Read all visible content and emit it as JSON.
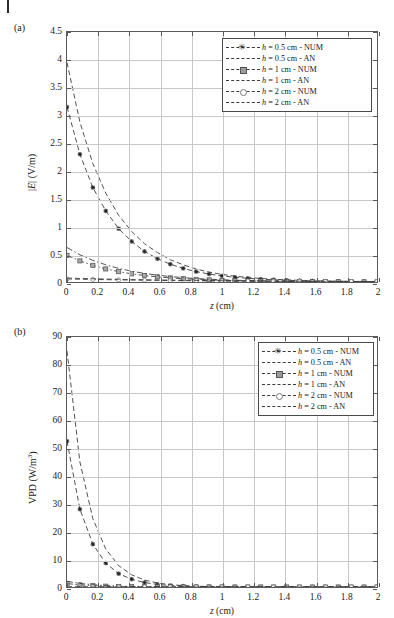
{
  "header": {
    "rule": "page-edge-rule",
    "faded_text": ""
  },
  "figure": {
    "panels": [
      {
        "id": "a",
        "label": "(a)",
        "xlabel_italic": "z",
        "xlabel_unit": " (cm)",
        "ylabel": "|E| (V/m)",
        "ylabel_italic": "E",
        "ylabel_pre": "|",
        "ylabel_post": "| (V/m)"
      },
      {
        "id": "b",
        "label": "(b)",
        "xlabel_italic": "z",
        "xlabel_unit": " (cm)",
        "ylabel": "VPD (W/m3)",
        "ylabel_pre": "VPD (W/m",
        "ylabel_sup": "3",
        "ylabel_post": ")"
      }
    ],
    "legend_entries": [
      {
        "label": "h = 0.5 cm - NUM",
        "style": "dashed",
        "marker": "star"
      },
      {
        "label": "h = 0.5 cm - AN",
        "style": "dashed",
        "marker": "none"
      },
      {
        "label": "h = 1 cm - NUM",
        "style": "dash-dot",
        "marker": "square"
      },
      {
        "label": "h = 1 cm - AN",
        "style": "dash-dot",
        "marker": "none"
      },
      {
        "label": "h = 2 cm - NUM",
        "style": "dashed",
        "marker": "circle"
      },
      {
        "label": "h = 2 cm - AN",
        "style": "dashed",
        "marker": "none"
      }
    ],
    "legend_label_parts": [
      {
        "it": "h",
        "rest": " = 0.5 cm - NUM"
      },
      {
        "it": "h",
        "rest": " = 0.5 cm - AN"
      },
      {
        "it": "h",
        "rest": " = 1 cm - NUM"
      },
      {
        "it": "h",
        "rest": " = 1 cm - AN"
      },
      {
        "it": "h",
        "rest": " = 2 cm - NUM"
      },
      {
        "it": "h",
        "rest": " = 2 cm - AN"
      }
    ]
  },
  "chart_data": [
    {
      "type": "line",
      "panel": "a",
      "title": "",
      "xlabel": "z (cm)",
      "ylabel": "|E| (V/m)",
      "xlim": [
        0,
        2
      ],
      "ylim": [
        0,
        4.5
      ],
      "xticks": [
        0,
        0.2,
        0.4,
        0.6,
        0.8,
        1,
        1.2,
        1.4,
        1.6,
        1.8,
        2
      ],
      "xticklabels": [
        "0",
        "0.2",
        "0.4",
        "0.6",
        "0.8",
        "1",
        "1.2",
        "1.4",
        "1.6",
        "1.8",
        "2"
      ],
      "yticks": [
        0,
        0.5,
        1,
        1.5,
        2,
        2.5,
        3,
        3.5,
        4,
        4.5
      ],
      "yticklabels": [
        "0",
        "0.5",
        "1",
        "1.5",
        "2",
        "2.5",
        "3",
        "3.5",
        "4",
        "4.5"
      ],
      "grid": true,
      "legend_position": "upper right",
      "x": [
        0,
        0.0833,
        0.1667,
        0.25,
        0.3333,
        0.4167,
        0.5,
        0.5833,
        0.6667,
        0.75,
        0.8333,
        0.9167,
        1.0,
        1.0833,
        1.1667,
        1.25,
        1.3333,
        1.4167,
        1.5,
        1.5833,
        1.6667,
        1.75,
        1.8333,
        1.9167,
        2.0
      ],
      "series": [
        {
          "name": "h = 0.5 cm - NUM",
          "marker": "star",
          "linestyle": "dashed",
          "values": [
            3.15,
            2.3,
            1.7,
            1.28,
            0.96,
            0.73,
            0.55,
            0.42,
            0.32,
            0.245,
            0.187,
            0.143,
            0.11,
            0.085,
            0.066,
            0.051,
            0.04,
            0.031,
            0.024,
            0.019,
            0.015,
            0.012,
            0.01,
            0.008,
            0.006
          ]
        },
        {
          "name": "h = 0.5 cm - AN",
          "marker": "none",
          "linestyle": "dashed",
          "values": [
            3.95,
            2.88,
            2.13,
            1.6,
            1.2,
            0.91,
            0.69,
            0.53,
            0.4,
            0.31,
            0.234,
            0.179,
            0.137,
            0.106,
            0.082,
            0.064,
            0.05,
            0.039,
            0.03,
            0.024,
            0.019,
            0.015,
            0.012,
            0.01,
            0.008
          ]
        },
        {
          "name": "h = 1 cm - NUM",
          "marker": "square",
          "linestyle": "dash-dot",
          "values": [
            0.48,
            0.38,
            0.3,
            0.235,
            0.186,
            0.147,
            0.117,
            0.093,
            0.074,
            0.059,
            0.047,
            0.038,
            0.03,
            0.024,
            0.019,
            0.016,
            0.013,
            0.01,
            0.008,
            0.007,
            0.005,
            0.004,
            0.004,
            0.003,
            0.002
          ]
        },
        {
          "name": "h = 1 cm - AN",
          "marker": "none",
          "linestyle": "dash-dot",
          "values": [
            0.62,
            0.49,
            0.39,
            0.31,
            0.245,
            0.195,
            0.155,
            0.123,
            0.098,
            0.078,
            0.062,
            0.05,
            0.04,
            0.032,
            0.026,
            0.021,
            0.017,
            0.013,
            0.011,
            0.009,
            0.007,
            0.006,
            0.005,
            0.004,
            0.003
          ]
        },
        {
          "name": "h = 2 cm - NUM",
          "marker": "circle",
          "linestyle": "dashed",
          "values": [
            0.055,
            0.05,
            0.046,
            0.042,
            0.038,
            0.035,
            0.032,
            0.029,
            0.026,
            0.024,
            0.022,
            0.02,
            0.018,
            0.016,
            0.015,
            0.014,
            0.012,
            0.011,
            0.01,
            0.009,
            0.008,
            0.008,
            0.007,
            0.006,
            0.006
          ]
        },
        {
          "name": "h = 2 cm - AN",
          "marker": "none",
          "linestyle": "dashed",
          "values": [
            0.07,
            0.064,
            0.058,
            0.053,
            0.049,
            0.044,
            0.04,
            0.037,
            0.034,
            0.031,
            0.028,
            0.026,
            0.023,
            0.021,
            0.019,
            0.018,
            0.016,
            0.015,
            0.013,
            0.012,
            0.011,
            0.01,
            0.009,
            0.008,
            0.008
          ]
        }
      ]
    },
    {
      "type": "line",
      "panel": "b",
      "title": "",
      "xlabel": "z (cm)",
      "ylabel": "VPD (W/m3)",
      "xlim": [
        0,
        2
      ],
      "ylim": [
        0,
        90
      ],
      "xticks": [
        0,
        0.2,
        0.4,
        0.6,
        0.8,
        1,
        1.2,
        1.4,
        1.6,
        1.8,
        2
      ],
      "xticklabels": [
        "0",
        "0.2",
        "0.4",
        "0.6",
        "0.8",
        "1",
        "1.2",
        "1.4",
        "1.6",
        "1.8",
        "2"
      ],
      "yticks": [
        0,
        10,
        20,
        30,
        40,
        50,
        60,
        70,
        80,
        90
      ],
      "yticklabels": [
        "0",
        "10",
        "20",
        "30",
        "40",
        "50",
        "60",
        "70",
        "80",
        "90"
      ],
      "grid": true,
      "legend_position": "upper right",
      "x": [
        0,
        0.0833,
        0.1667,
        0.25,
        0.3333,
        0.4167,
        0.5,
        0.5833,
        0.6667,
        0.75,
        0.8333,
        0.9167,
        1.0,
        1.0833,
        1.1667,
        1.25,
        1.3333,
        1.4167,
        1.5,
        1.5833,
        1.6667,
        1.75,
        1.8333,
        1.9167,
        2.0
      ],
      "series": [
        {
          "name": "h = 0.5 cm - NUM",
          "marker": "star",
          "linestyle": "dashed",
          "values": [
            52.5,
            28.0,
            15.4,
            8.6,
            4.8,
            2.8,
            1.6,
            0.93,
            0.54,
            0.32,
            0.19,
            0.11,
            0.065,
            0.04,
            0.024,
            0.014,
            0.009,
            0.005,
            0.003,
            0.002,
            0.001,
            0.001,
            0.0,
            0.0,
            0.0
          ]
        },
        {
          "name": "h = 0.5 cm - AN",
          "marker": "none",
          "linestyle": "dashed",
          "values": [
            85.0,
            45.0,
            24.6,
            13.7,
            7.7,
            4.4,
            2.5,
            1.45,
            0.85,
            0.5,
            0.29,
            0.17,
            0.1,
            0.06,
            0.036,
            0.021,
            0.013,
            0.008,
            0.005,
            0.003,
            0.002,
            0.001,
            0.001,
            0.0,
            0.0
          ]
        },
        {
          "name": "h = 1 cm - NUM",
          "marker": "square",
          "linestyle": "dash-dot",
          "values": [
            1.22,
            0.77,
            0.48,
            0.3,
            0.19,
            0.12,
            0.075,
            0.047,
            0.03,
            0.019,
            0.012,
            0.008,
            0.005,
            0.003,
            0.002,
            0.001,
            0.001,
            0.001,
            0.0,
            0.0,
            0.0,
            0.0,
            0.0,
            0.0,
            0.0
          ]
        },
        {
          "name": "h = 1 cm - AN",
          "marker": "none",
          "linestyle": "dash-dot",
          "values": [
            2.05,
            1.29,
            0.81,
            0.51,
            0.32,
            0.2,
            0.126,
            0.079,
            0.05,
            0.031,
            0.02,
            0.012,
            0.008,
            0.005,
            0.003,
            0.002,
            0.001,
            0.001,
            0.0,
            0.0,
            0.0,
            0.0,
            0.0,
            0.0,
            0.0
          ]
        },
        {
          "name": "h = 2 cm - NUM",
          "marker": "circle",
          "linestyle": "dashed",
          "values": [
            0.016,
            0.013,
            0.011,
            0.009,
            0.008,
            0.006,
            0.005,
            0.004,
            0.004,
            0.003,
            0.002,
            0.002,
            0.002,
            0.001,
            0.001,
            0.001,
            0.001,
            0.001,
            0.0,
            0.0,
            0.0,
            0.0,
            0.0,
            0.0,
            0.0
          ]
        },
        {
          "name": "h = 2 cm - AN",
          "marker": "none",
          "linestyle": "dashed",
          "values": [
            0.026,
            0.022,
            0.018,
            0.015,
            0.013,
            0.011,
            0.009,
            0.007,
            0.006,
            0.005,
            0.004,
            0.003,
            0.003,
            0.002,
            0.002,
            0.002,
            0.001,
            0.001,
            0.001,
            0.001,
            0.001,
            0.0,
            0.0,
            0.0,
            0.0
          ]
        }
      ]
    }
  ]
}
